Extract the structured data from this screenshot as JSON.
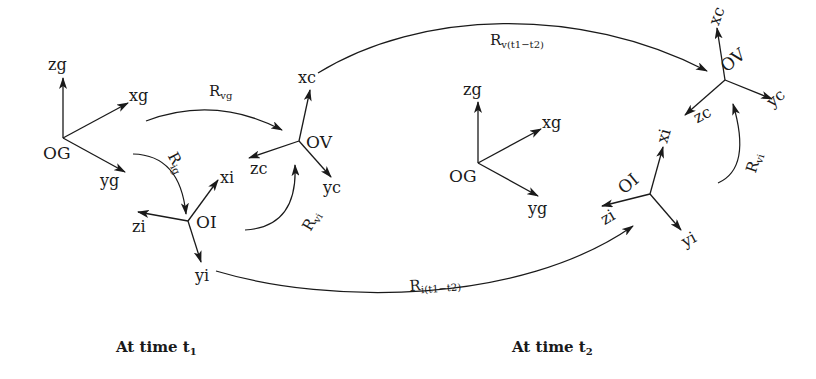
{
  "diagram": {
    "time1": {
      "caption_main": "At time t",
      "caption_sub": "1",
      "frames": {
        "global": {
          "origin": "OG",
          "axes": {
            "z": "zg",
            "x": "xg",
            "y": "yg"
          }
        },
        "imu": {
          "origin": "OI",
          "axes": {
            "x": "xi",
            "z": "zi",
            "y": "yi"
          }
        },
        "vision": {
          "origin": "OV",
          "axes": {
            "x": "xc",
            "z": "zc",
            "y": "yc"
          }
        }
      },
      "rotations": {
        "vg": {
          "main": "R",
          "sub": "vg"
        },
        "ig": {
          "main": "R",
          "sub": "ig"
        },
        "vi": {
          "main": "R",
          "sub": "vi"
        }
      }
    },
    "time2": {
      "caption_main": "At time t",
      "caption_sub": "2",
      "frames": {
        "global": {
          "origin": "OG",
          "axes": {
            "z": "zg",
            "x": "xg",
            "y": "yg"
          }
        },
        "imu": {
          "origin": "OI",
          "axes": {
            "x": "xi",
            "z": "zi",
            "y": "yi"
          }
        },
        "vision": {
          "origin": "OV",
          "axes": {
            "x": "xc",
            "z": "zc",
            "y": "yc"
          }
        }
      },
      "rotations": {
        "vi": {
          "main": "R",
          "sub": "vi"
        }
      }
    },
    "transitions": {
      "vision": {
        "main": "R",
        "sub": "v(t1−t2)"
      },
      "imu": {
        "main": "R",
        "sub": "i(t1−t2)"
      }
    },
    "colors": {
      "ink": "#1a1a1a",
      "background": "#ffffff"
    }
  }
}
